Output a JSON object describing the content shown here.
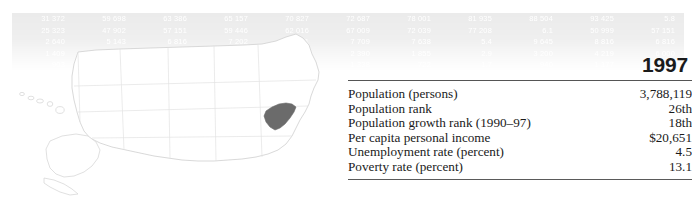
{
  "panel": {
    "year": "1997",
    "rows": [
      {
        "label": "Population (persons)",
        "value": "3,788,119"
      },
      {
        "label": "Population rank",
        "value": "26th"
      },
      {
        "label": "Population growth rank (1990–97)",
        "value": "18th"
      },
      {
        "label": "Per capita personal income",
        "value": "$20,651"
      },
      {
        "label": "Unemployment rate (percent)",
        "value": "4.5"
      },
      {
        "label": "Poverty rate (percent)",
        "value": "13.1"
      }
    ]
  },
  "map": {
    "highlighted_state": "South Carolina",
    "highlight_color": "#6b6b6b",
    "outline_color": "#d2d2d2",
    "insets": [
      "Alaska",
      "Hawaii"
    ]
  },
  "watermark": {
    "rows": [
      [
        "31 372",
        "59 698",
        "63 386",
        "65 157",
        "70 827",
        "72 687",
        "78 001",
        "81 935",
        "88 504",
        "93 425",
        "5.8",
        "63 383",
        "70 827",
        "31 372",
        "59 698",
        "63 386"
      ],
      [
        "25 323",
        "47 902",
        "57 151",
        "59 446",
        "62 016",
        "67 009",
        "72 039",
        "77 208",
        "6.1",
        "50 999",
        "57 151",
        "25 323",
        "47 902",
        "50 999",
        "62 016",
        "67 009"
      ],
      [
        "2 640",
        "5 143",
        "6 816",
        "7 202",
        "7 801",
        "7 709",
        "7 638",
        "5.4",
        "9 645",
        "8 816",
        "6 816",
        "2 640",
        "5 143",
        "5 645",
        "7 202",
        "7 801"
      ],
      [
        "1 409",
        "6 050",
        "4 000",
        "3 596",
        "1 935",
        "2 390",
        "1 855",
        "2.9",
        "3 200",
        "4 219",
        "6 000",
        "1 409",
        "6 050",
        "4 272",
        "3 596",
        "1 935"
      ],
      [
        "903",
        "1 216",
        "852",
        "1 104",
        "967",
        "1 338",
        "722",
        "1.7",
        "940",
        "1 177",
        "812",
        "903",
        "1 216",
        "1 006",
        "1 104",
        "967"
      ]
    ]
  }
}
